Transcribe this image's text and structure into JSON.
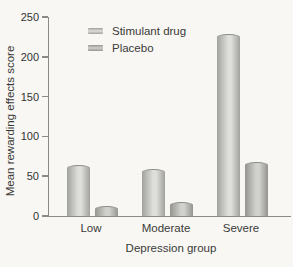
{
  "figure": {
    "background": "#f8f7f4",
    "axis_color": "#8a8a88",
    "text_color": "#3a3a38"
  },
  "chart_data": {
    "type": "bar",
    "title": "",
    "categories": [
      "Low",
      "Moderate",
      "Severe"
    ],
    "series": [
      {
        "name": "Stimulant drug",
        "values": [
          63,
          58,
          228
        ],
        "colors": {
          "edge": "#a1a19d",
          "mid": "#dededa"
        }
      },
      {
        "name": "Placebo",
        "values": [
          11,
          16,
          67
        ],
        "colors": {
          "edge": "#959590",
          "mid": "#d1d1cd"
        }
      }
    ],
    "xlabel": "Depression group",
    "ylabel": "Mean rewarding effects score",
    "ylim": [
      0,
      250
    ],
    "yticks": [
      0,
      50,
      100,
      150,
      200,
      250
    ],
    "grid": false,
    "legend_position": "top-left-inside"
  }
}
